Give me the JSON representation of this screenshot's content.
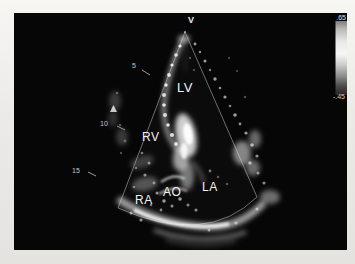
{
  "figure": {
    "type": "2D echocardiogram photograph",
    "orientation_marker": "V",
    "chamber_labels": {
      "lv": "LV",
      "rv": "RV",
      "ra": "RA",
      "ao": "AO",
      "la": "LA"
    },
    "depth_markers": {
      "d5": "5",
      "d10": "10",
      "d15": "15"
    },
    "gray_bar": {
      "top_label": ".65",
      "bottom_label": "-.45"
    },
    "colors": {
      "page_background": "#eceae6",
      "photo_background": "#060606",
      "label_color": "#f2f2f2",
      "sector_outline": "#8f8f8f"
    }
  }
}
